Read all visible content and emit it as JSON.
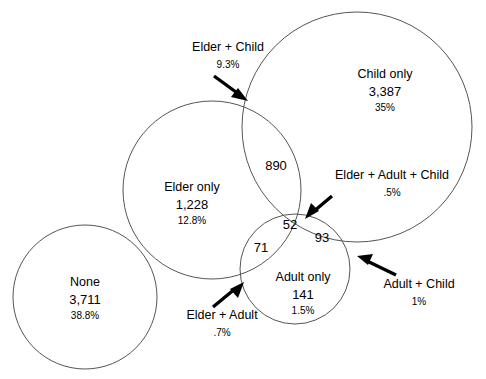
{
  "figure": {
    "type": "venn-diagram",
    "width": 486,
    "height": 379,
    "background": "#ffffff",
    "stroke_color": "#555555",
    "arrow_color": "#000000"
  },
  "chart_data": {
    "type": "venn",
    "title": "",
    "sets": [
      "Elder",
      "Adult",
      "Child"
    ],
    "total_implied": 9563,
    "regions": [
      {
        "key": "none",
        "label": "None",
        "count": "3,711",
        "percent": "38.8%"
      },
      {
        "key": "elder_only",
        "label": "Elder only",
        "count": "1,228",
        "percent": "12.8%"
      },
      {
        "key": "child_only",
        "label": "Child only",
        "count": "3,387",
        "percent": "35%"
      },
      {
        "key": "adult_only",
        "label": "Adult only",
        "count": "141",
        "percent": "1.5%"
      },
      {
        "key": "elder_child",
        "label": "Elder + Child",
        "count": "890",
        "percent": "9.3%"
      },
      {
        "key": "elder_adult",
        "label": "Elder + Adult",
        "count": "71",
        "percent": ".7%"
      },
      {
        "key": "adult_child",
        "label": "Adult + Child",
        "count": "93",
        "percent": "1%"
      },
      {
        "key": "elder_adult_child",
        "label": "Elder + Adult + Child",
        "count": "52",
        "percent": ".5%"
      }
    ],
    "circles": [
      {
        "key": "child",
        "cx": 357,
        "cy": 127,
        "r": 115
      },
      {
        "key": "elder",
        "cx": 212,
        "cy": 190,
        "r": 89
      },
      {
        "key": "adult",
        "cx": 295,
        "cy": 269,
        "r": 55
      },
      {
        "key": "none",
        "cx": 85,
        "cy": 297,
        "r": 72
      }
    ]
  },
  "labels": {
    "none": {
      "name": "None",
      "count": "3,711",
      "percent": "38.8%"
    },
    "elder_only": {
      "name": "Elder only",
      "count": "1,228",
      "percent": "12.8%"
    },
    "child_only": {
      "name": "Child only",
      "count": "3,387",
      "percent": "35%"
    },
    "adult_only": {
      "name": "Adult only",
      "count": "141",
      "percent": "1.5%"
    }
  },
  "callouts": {
    "elder_child": {
      "name": "Elder + Child",
      "percent": "9.3%"
    },
    "elder_adult_child": {
      "name": "Elder + Adult + Child",
      "percent": ".5%"
    },
    "elder_adult": {
      "name": "Elder + Adult",
      "percent": ".7%"
    },
    "adult_child": {
      "name": "Adult + Child",
      "percent": "1%"
    }
  },
  "region_numbers": {
    "elder_child": "890",
    "elder_adult_child": "52",
    "elder_adult": "71",
    "adult_child": "93"
  }
}
